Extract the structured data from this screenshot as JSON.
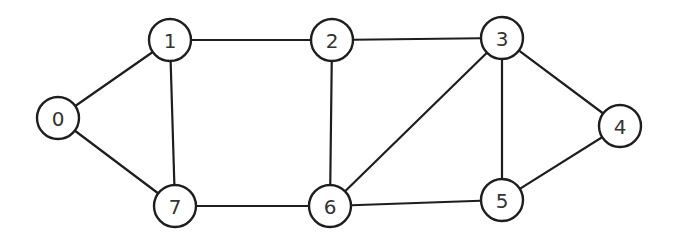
{
  "graph": {
    "node_radius": 21,
    "colors": {
      "stroke": "#1e1e1e",
      "fill": "#ffffff",
      "label": "#333333"
    },
    "nodes": [
      {
        "id": "0",
        "label": "0",
        "x": 58,
        "y": 118
      },
      {
        "id": "1",
        "label": "1",
        "x": 170,
        "y": 40
      },
      {
        "id": "2",
        "label": "2",
        "x": 332,
        "y": 40
      },
      {
        "id": "3",
        "label": "3",
        "x": 502,
        "y": 38
      },
      {
        "id": "4",
        "label": "4",
        "x": 620,
        "y": 126
      },
      {
        "id": "5",
        "label": "5",
        "x": 502,
        "y": 200
      },
      {
        "id": "6",
        "label": "6",
        "x": 330,
        "y": 206
      },
      {
        "id": "7",
        "label": "7",
        "x": 175,
        "y": 206
      }
    ],
    "edges": [
      [
        "0",
        "1"
      ],
      [
        "0",
        "7"
      ],
      [
        "1",
        "2"
      ],
      [
        "1",
        "7"
      ],
      [
        "2",
        "3"
      ],
      [
        "2",
        "6"
      ],
      [
        "3",
        "6"
      ],
      [
        "3",
        "5"
      ],
      [
        "3",
        "4"
      ],
      [
        "4",
        "5"
      ],
      [
        "5",
        "6"
      ],
      [
        "6",
        "7"
      ]
    ]
  }
}
